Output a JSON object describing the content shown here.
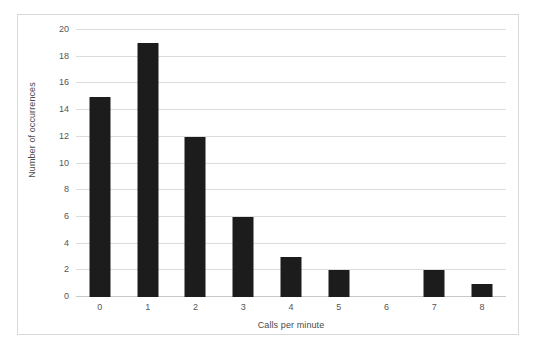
{
  "chart_data": {
    "type": "bar",
    "title": "",
    "xlabel": "Calls per minute",
    "ylabel": "Number of occurrences",
    "categories": [
      "0",
      "1",
      "2",
      "3",
      "4",
      "5",
      "6",
      "7",
      "8"
    ],
    "values": [
      15,
      19,
      12,
      6,
      3,
      2,
      0,
      2,
      1
    ],
    "ylim": [
      0,
      20
    ],
    "y_ticks": [
      "0",
      "2",
      "4",
      "6",
      "8",
      "10",
      "12",
      "14",
      "16",
      "18",
      "20"
    ],
    "y_tick_values": [
      0,
      2,
      4,
      6,
      8,
      10,
      12,
      14,
      16,
      18,
      20
    ],
    "grid": true,
    "legend": false,
    "bar_color": "#1c1c1c",
    "gridline_color": "#dcdcdc",
    "frame_color": "#d9d9d9",
    "background_color": "#ffffff"
  }
}
